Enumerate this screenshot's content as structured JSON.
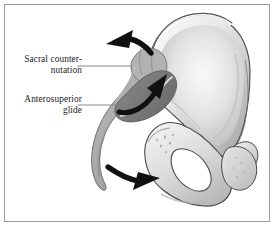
{
  "figure": {
    "type": "anatomical-illustration",
    "background_color": "#ffffff",
    "border_color": "#9a9a9a",
    "panel": {
      "width": 276,
      "height": 228
    }
  },
  "labels": [
    {
      "id": "sacral-counternutation",
      "text": "Sacral counter-\nnutation",
      "lines": [
        "Sacral counter-",
        "nutation"
      ],
      "align": "right",
      "leader_line": {
        "x1": 77,
        "y1": 66,
        "x2": 131,
        "y2": 66
      }
    },
    {
      "id": "anterosuperior-glide",
      "text": "Anterosuperior\nglide",
      "lines": [
        "Anterosuperior",
        "glide"
      ],
      "align": "right",
      "leader_line": {
        "x1": 78,
        "y1": 105,
        "x2": 119,
        "y2": 105
      }
    }
  ],
  "arrows": [
    {
      "id": "superior-arrow",
      "direction": "up-left",
      "description": "Curved arrow at iliac crest indicating sacral counter-nutation",
      "color": "#111111"
    },
    {
      "id": "glide-arrow",
      "direction": "up-right",
      "description": "Curved arrow along sacroiliac joint indicating anterosuperior glide",
      "color": "#111111"
    },
    {
      "id": "inferior-arrow",
      "direction": "down-right",
      "description": "Curved arrow at ischium indicating inferior-posterior movement",
      "color": "#111111"
    }
  ],
  "structures": [
    {
      "id": "ilium",
      "name": "ilium",
      "fill": "#ededed",
      "stroke": "#4a4a4a"
    },
    {
      "id": "sacrum",
      "name": "sacrum-and-coccyx",
      "fill": "#a8a8a8",
      "stroke": "#6e6e6e"
    },
    {
      "id": "sacroiliac-band",
      "name": "sacroiliac-joint-band",
      "fill": "#7a7a7a",
      "stroke": "#5a5a5a"
    },
    {
      "id": "obturator-foramen",
      "name": "obturator-foramen",
      "fill": "#ffffff",
      "stroke": "#4a4a4a"
    },
    {
      "id": "ischial-tuberosity",
      "name": "ischial-tuberosity",
      "fill": "#d8d8d8",
      "stroke": "#5a5a5a"
    },
    {
      "id": "pubis",
      "name": "superior-pubic-ramus",
      "fill": "#e2e2e2",
      "stroke": "#4a4a4a"
    }
  ],
  "colors": {
    "bone_light": "#ededed",
    "bone_mid": "#d2d2d2",
    "bone_shadow": "#9f9f9f",
    "sacrum_gray": "#a8a8a8",
    "joint_dark": "#7a7a7a",
    "outline": "#4a4a4a",
    "arrow": "#111111",
    "text": "#1b1b1b",
    "leader": "#7d7d7d"
  }
}
